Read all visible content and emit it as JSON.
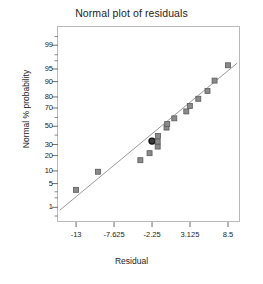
{
  "chart_data": {
    "type": "scatter",
    "title": "Normal plot of residuals",
    "xlabel": "Residual",
    "ylabel": "Normal % probability",
    "grid": false,
    "legend": "none",
    "xlim": [
      -15.7,
      10.2
    ],
    "x_ticks": [
      -13,
      -7.625,
      -2.25,
      3.125,
      8.5
    ],
    "x_tick_labels": [
      "-13",
      "-7.625",
      "-2.25",
      "3.125",
      "8.5"
    ],
    "y_scale": "normal-probability",
    "ylim": [
      0.3,
      99.8
    ],
    "y_ticks": [
      1,
      5,
      10,
      20,
      30,
      50,
      70,
      80,
      90,
      95,
      99
    ],
    "y_tick_labels": [
      "1",
      "5",
      "10",
      "20",
      "30",
      "50",
      "70",
      "80",
      "90",
      "95",
      "99"
    ],
    "y_minor_ticks": [
      0.5,
      2,
      3,
      40,
      60,
      97,
      98,
      99.5
    ],
    "marker": {
      "shape": "square",
      "fill": "#8a8a8a",
      "edge": "#5a5a5a",
      "size": 5
    },
    "highlight_marker": {
      "shape": "circle",
      "fill": "#3a3a3a",
      "edge": "#111111",
      "size": 6
    },
    "reference_line": {
      "color": "#9a9a9a",
      "width": 1,
      "x_start": -15.3,
      "y_start": 0.8,
      "x_end": 9.8,
      "y_end": 96.5
    },
    "points": [
      {
        "x": -13.0,
        "y": 3.4,
        "highlight": false
      },
      {
        "x": -9.9,
        "y": 9.6,
        "highlight": false
      },
      {
        "x": -3.9,
        "y": 16.5,
        "highlight": false
      },
      {
        "x": -2.6,
        "y": 22.0,
        "highlight": false
      },
      {
        "x": -2.25,
        "y": 33.5,
        "highlight": true
      },
      {
        "x": -1.45,
        "y": 28.0,
        "highlight": false
      },
      {
        "x": -1.45,
        "y": 33.0,
        "highlight": false
      },
      {
        "x": -1.4,
        "y": 39.0,
        "highlight": false
      },
      {
        "x": -0.2,
        "y": 48.5,
        "highlight": false
      },
      {
        "x": -0.1,
        "y": 52.5,
        "highlight": false
      },
      {
        "x": 0.9,
        "y": 59.0,
        "highlight": false
      },
      {
        "x": 2.6,
        "y": 66.5,
        "highlight": false
      },
      {
        "x": 3.1,
        "y": 72.0,
        "highlight": false
      },
      {
        "x": 4.3,
        "y": 78.5,
        "highlight": false
      },
      {
        "x": 5.6,
        "y": 84.5,
        "highlight": false
      },
      {
        "x": 6.6,
        "y": 90.5,
        "highlight": false
      },
      {
        "x": 8.5,
        "y": 96.0,
        "highlight": false
      }
    ]
  }
}
